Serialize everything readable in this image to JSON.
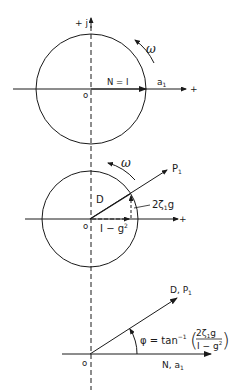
{
  "colors": {
    "ink": "#1a1a1a",
    "background": "#ffffff"
  },
  "panels": [
    {
      "id": "panel-1",
      "axis_imag_label": "+ j",
      "axis_real_plus": "+",
      "origin_label": "o",
      "rotation_label": "ω",
      "vector_label": "N = I",
      "vector_end_label": "a",
      "vector_end_sub": "1"
    },
    {
      "id": "panel-2",
      "rotation_label": "ω",
      "origin_label": "o",
      "axis_real_plus": "+",
      "resultant_label": "D",
      "extended_label": "P",
      "extended_sub": "1",
      "imag_component_label_a": "2ζ",
      "imag_component_sub": "1",
      "imag_component_label_b": "g",
      "real_component_label": "I − g",
      "real_component_sup": "2"
    },
    {
      "id": "panel-3",
      "origin_label": "o",
      "vector_label": "D, P",
      "vector_sub": "1",
      "base_label": "N, a",
      "base_sub": "1",
      "phase_formula": {
        "lhs": "φ = tan",
        "exp": "−1",
        "numerator_a": "2ζ",
        "numerator_sub": "1",
        "numerator_b": "g",
        "denominator": "I − g",
        "denominator_sup": "2"
      }
    }
  ]
}
